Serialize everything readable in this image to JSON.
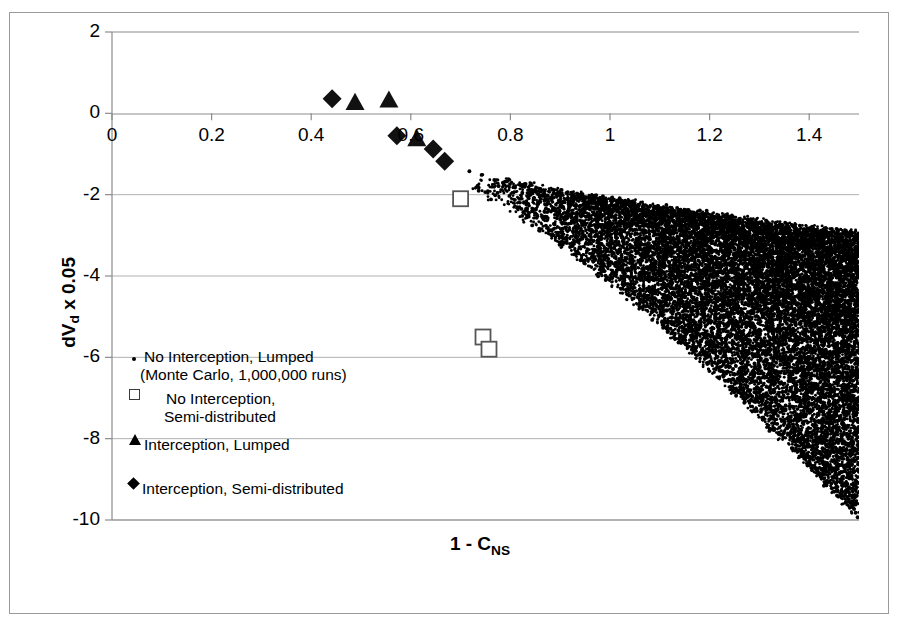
{
  "chart_data": {
    "type": "scatter",
    "title": "",
    "xlabel": "1 - C_NS",
    "xlabel_main": "1 - C",
    "xlabel_sub": "NS",
    "ylabel": "dV_d x 0.05",
    "ylabel_pre": "dV",
    "ylabel_sub": "d",
    "ylabel_post": " x 0.05",
    "xlim": [
      0,
      1.5
    ],
    "ylim": [
      -10,
      2
    ],
    "xticks": [
      0,
      0.2,
      0.4,
      0.6,
      0.8,
      1,
      1.2,
      1.4
    ],
    "xtick_labels": [
      "0",
      "0.2",
      "0.4",
      "0.6",
      "0.8",
      "1",
      "1.2",
      "1.4"
    ],
    "yticks": [
      2,
      0,
      -2,
      -4,
      -6,
      -8,
      -10
    ],
    "ytick_labels": [
      "2",
      "0",
      "-2",
      "-4",
      "-6",
      "-8",
      "-10"
    ],
    "grid": "horizontal",
    "grid_color": "#b0b0b0",
    "axis_color": "#808080",
    "marker_color": "#000000",
    "legend_position": "inside-left-lower",
    "series": [
      {
        "name": "No Interception, Lumped (Monte Carlo, 1,000,000 runs)",
        "marker": "dot",
        "n_points": 1000000,
        "description": "Dense downward-right expanding wedge cloud",
        "x_range": [
          0.72,
          1.5
        ],
        "y_range": [
          -9.9,
          -1.3
        ],
        "points": []
      },
      {
        "name": "No Interception, Semi-distributed",
        "marker": "open-square",
        "points": [
          {
            "x": 0.7,
            "y": -2.1
          },
          {
            "x": 0.745,
            "y": -5.5
          },
          {
            "x": 0.757,
            "y": -5.8
          }
        ]
      },
      {
        "name": "Interception, Lumped",
        "marker": "filled-triangle",
        "points": [
          {
            "x": 0.488,
            "y": 0.27
          },
          {
            "x": 0.556,
            "y": 0.33
          },
          {
            "x": 0.612,
            "y": -0.62
          }
        ]
      },
      {
        "name": "Interception, Semi-distributed",
        "marker": "filled-diamond",
        "points": [
          {
            "x": 0.442,
            "y": 0.36
          },
          {
            "x": 0.572,
            "y": -0.55
          },
          {
            "x": 0.645,
            "y": -0.88
          },
          {
            "x": 0.668,
            "y": -1.18
          }
        ]
      }
    ]
  },
  "legend": {
    "items": [
      {
        "marker": "dot",
        "line1": "No Interception, Lumped",
        "line2": "(Monte Carlo, 1,000,000 runs)"
      },
      {
        "marker": "open-square",
        "line1": "No Interception,",
        "line2": "Semi-distributed"
      },
      {
        "marker": "filled-triangle",
        "line1": "Interception, Lumped",
        "line2": ""
      },
      {
        "marker": "filled-diamond",
        "line1": "Interception, Semi-distributed",
        "line2": ""
      }
    ]
  }
}
